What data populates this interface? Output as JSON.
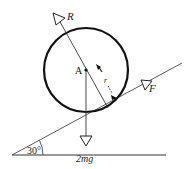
{
  "diagram": {
    "type": "physics-free-body",
    "labels": {
      "reaction": "R",
      "center": "A",
      "radius": "r",
      "friction": "F",
      "weight": "2mg",
      "angle": "30°"
    },
    "geometry": {
      "incline_angle_deg": 30,
      "circle_center": [
        86,
        70
      ],
      "circle_radius": 42
    },
    "colors": {
      "stroke": "#1a1a1a",
      "background": "#ffffff"
    }
  }
}
